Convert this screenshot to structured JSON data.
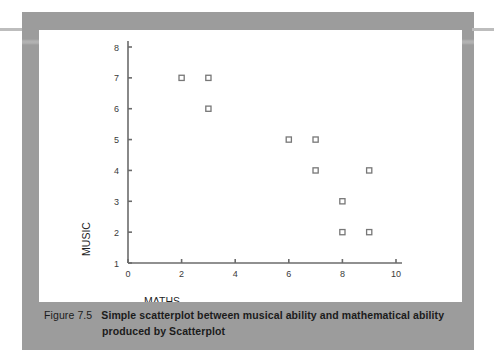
{
  "figure": {
    "caption_label": "Figure 7.5",
    "caption_text": "Simple scatterplot between musical ability and mathematical ability",
    "caption_line2": "produced by Scatterplot"
  },
  "chart_data": {
    "type": "scatter",
    "title": "",
    "xlabel": "MATHS",
    "ylabel": "MUSIC",
    "xlim": [
      0,
      10
    ],
    "ylim": [
      1,
      8
    ],
    "xticks": [
      0,
      2,
      4,
      6,
      8,
      10
    ],
    "yticks": [
      1,
      2,
      3,
      4,
      5,
      6,
      7,
      8
    ],
    "xtick_labels": [
      "0",
      "2",
      "4",
      "6",
      "8",
      "10"
    ],
    "ytick_labels": [
      "1",
      "2",
      "3",
      "4",
      "5",
      "6",
      "7",
      "8"
    ],
    "grid": false,
    "legend": "none",
    "marker": "open-square",
    "marker_color": "#777777",
    "axis_color": "#6b6b6b",
    "points": [
      {
        "x": 2,
        "y": 7
      },
      {
        "x": 3,
        "y": 7
      },
      {
        "x": 3,
        "y": 6
      },
      {
        "x": 6,
        "y": 5
      },
      {
        "x": 7,
        "y": 5
      },
      {
        "x": 7,
        "y": 4
      },
      {
        "x": 9,
        "y": 4
      },
      {
        "x": 8,
        "y": 3
      },
      {
        "x": 8,
        "y": 2
      },
      {
        "x": 9,
        "y": 2
      }
    ]
  }
}
